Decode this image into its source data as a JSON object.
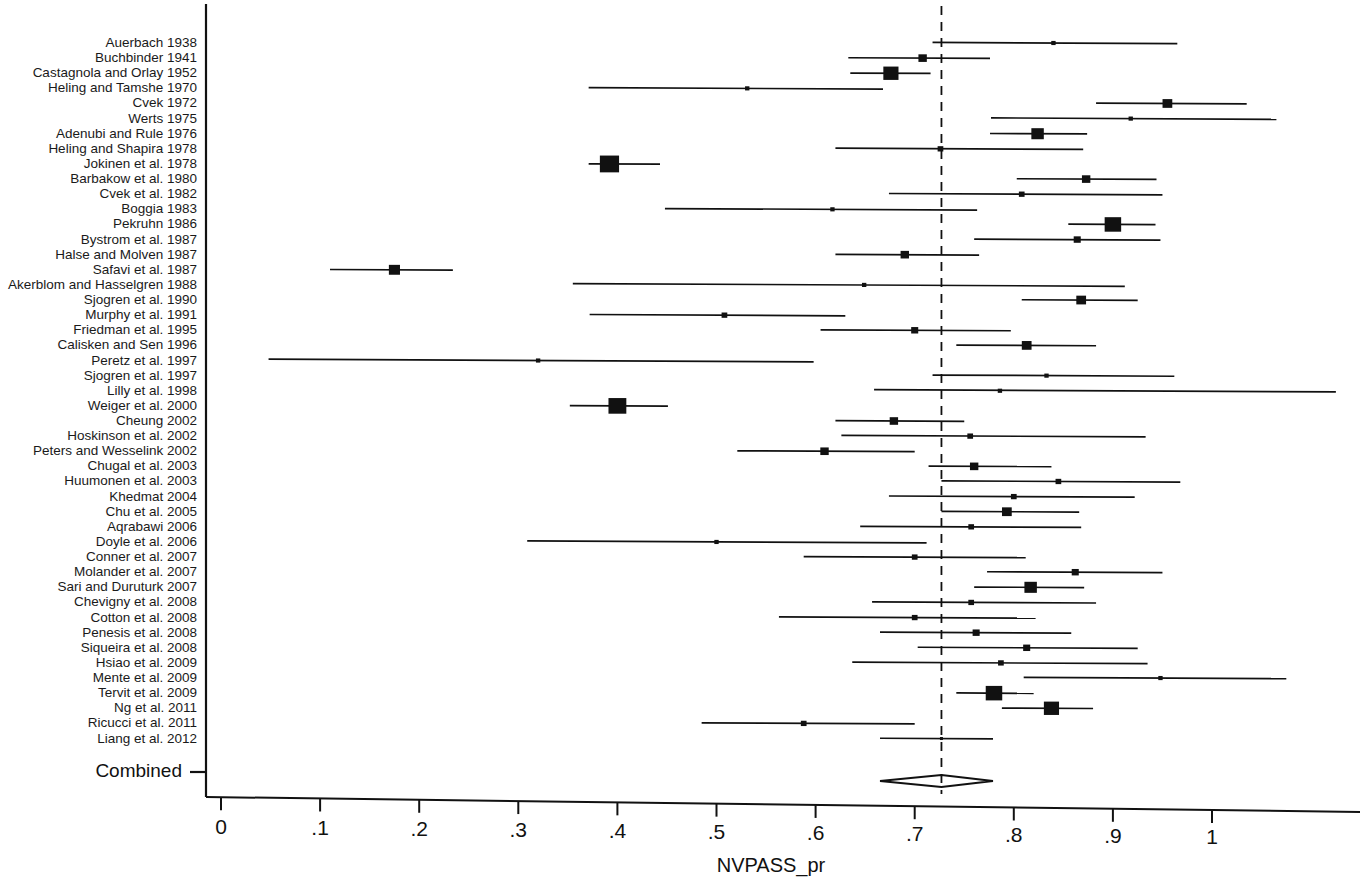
{
  "figure": {
    "type": "forest-plot",
    "axis_title": "NVPASS_pr",
    "combined_label": "Combined",
    "x_ticks": [
      "0",
      ".1",
      ".2",
      ".3",
      ".4",
      ".5",
      ".6",
      ".7",
      ".8",
      ".9",
      "1"
    ]
  },
  "chart_data": {
    "type": "forest",
    "title": "",
    "xlabel": "NVPASS_pr",
    "ylabel": "",
    "xlim": [
      0,
      1.12
    ],
    "xticks": [
      0,
      0.1,
      0.2,
      0.3,
      0.4,
      0.5,
      0.6,
      0.7,
      0.8,
      0.9,
      1.0
    ],
    "xticklabels": [
      "0",
      ".1",
      ".2",
      ".3",
      ".4",
      ".5",
      ".6",
      ".7",
      ".8",
      ".9",
      "1"
    ],
    "grid": false,
    "legend": "none",
    "reference_line": 0.727,
    "reference_line_style": "dashed",
    "effect_measure": "proportion",
    "overall": {
      "label": "Combined",
      "estimate": 0.727,
      "ci_low": 0.665,
      "ci_high": 0.779,
      "marker": "diamond"
    },
    "studies": [
      {
        "label": "Auerbach 1938",
        "estimate": 0.84,
        "ci_low": 0.718,
        "ci_high": 0.965,
        "weight": 1
      },
      {
        "label": "Buchbinder 1941",
        "estimate": 0.708,
        "ci_low": 0.633,
        "ci_high": 0.776,
        "weight": 4
      },
      {
        "label": "Castagnola and Orlay 1952",
        "estimate": 0.676,
        "ci_low": 0.635,
        "ci_high": 0.716,
        "weight": 9
      },
      {
        "label": "Heling and Tamshe 1970",
        "estimate": 0.531,
        "ci_low": 0.371,
        "ci_high": 0.668,
        "weight": 1
      },
      {
        "label": "Cvek 1972",
        "estimate": 0.955,
        "ci_low": 0.883,
        "ci_high": 1.035,
        "weight": 5
      },
      {
        "label": "Werts 1975",
        "estimate": 0.918,
        "ci_low": 0.777,
        "ci_high": 1.065,
        "weight": 1
      },
      {
        "label": "Adenubi and Rule 1976",
        "estimate": 0.824,
        "ci_low": 0.776,
        "ci_high": 0.874,
        "weight": 7
      },
      {
        "label": "Heling and Shapira 1978",
        "estimate": 0.726,
        "ci_low": 0.62,
        "ci_high": 0.87,
        "weight": 2
      },
      {
        "label": "Jokinen et al. 1978",
        "estimate": 0.392,
        "ci_low": 0.371,
        "ci_high": 0.443,
        "weight": 12
      },
      {
        "label": "Barbakow et al. 1980",
        "estimate": 0.873,
        "ci_low": 0.803,
        "ci_high": 0.944,
        "weight": 4
      },
      {
        "label": "Cvek et al. 1982",
        "estimate": 0.808,
        "ci_low": 0.674,
        "ci_high": 0.95,
        "weight": 2
      },
      {
        "label": "Boggia 1983",
        "estimate": 0.617,
        "ci_low": 0.448,
        "ci_high": 0.763,
        "weight": 1
      },
      {
        "label": "Pekruhn 1986",
        "estimate": 0.9,
        "ci_low": 0.855,
        "ci_high": 0.943,
        "weight": 10
      },
      {
        "label": "Bystrom et al. 1987",
        "estimate": 0.864,
        "ci_low": 0.76,
        "ci_high": 0.948,
        "weight": 3
      },
      {
        "label": "Halse and Molven 1987",
        "estimate": 0.69,
        "ci_low": 0.62,
        "ci_high": 0.765,
        "weight": 4
      },
      {
        "label": "Safavi et al. 1987",
        "estimate": 0.175,
        "ci_low": 0.11,
        "ci_high": 0.234,
        "weight": 6
      },
      {
        "label": "Akerblom and Hasselgren 1988",
        "estimate": 0.649,
        "ci_low": 0.355,
        "ci_high": 0.912,
        "weight": 1
      },
      {
        "label": "Sjogren et al. 1990",
        "estimate": 0.868,
        "ci_low": 0.808,
        "ci_high": 0.925,
        "weight": 5
      },
      {
        "label": "Murphy et al. 1991",
        "estimate": 0.508,
        "ci_low": 0.372,
        "ci_high": 0.63,
        "weight": 2
      },
      {
        "label": "Friedman et al. 1995",
        "estimate": 0.7,
        "ci_low": 0.605,
        "ci_high": 0.797,
        "weight": 3
      },
      {
        "label": "Calisken and Sen 1996",
        "estimate": 0.813,
        "ci_low": 0.742,
        "ci_high": 0.883,
        "weight": 5
      },
      {
        "label": "Peretz et al. 1997",
        "estimate": 0.32,
        "ci_low": 0.048,
        "ci_high": 0.598,
        "weight": 1
      },
      {
        "label": "Sjogren et al. 1997",
        "estimate": 0.833,
        "ci_low": 0.718,
        "ci_high": 0.962,
        "weight": 1
      },
      {
        "label": "Lilly et al. 1998",
        "estimate": 0.786,
        "ci_low": 0.659,
        "ci_high": 1.125,
        "weight": 1
      },
      {
        "label": "Weiger et al. 2000",
        "estimate": 0.4,
        "ci_low": 0.352,
        "ci_high": 0.451,
        "weight": 11
      },
      {
        "label": "Cheung 2002",
        "estimate": 0.679,
        "ci_low": 0.62,
        "ci_high": 0.75,
        "weight": 4
      },
      {
        "label": "Hoskinson et al. 2002",
        "estimate": 0.756,
        "ci_low": 0.626,
        "ci_high": 0.933,
        "weight": 2
      },
      {
        "label": "Peters and Wesselink 2002",
        "estimate": 0.609,
        "ci_low": 0.521,
        "ci_high": 0.7,
        "weight": 4
      },
      {
        "label": "Chugal et al. 2003",
        "estimate": 0.76,
        "ci_low": 0.714,
        "ci_high": 0.838,
        "weight": 4
      },
      {
        "label": "Huumonen et al. 2003",
        "estimate": 0.845,
        "ci_low": 0.727,
        "ci_high": 0.968,
        "weight": 2
      },
      {
        "label": "Khedmat 2004",
        "estimate": 0.8,
        "ci_low": 0.674,
        "ci_high": 0.922,
        "weight": 2
      },
      {
        "label": "Chu et al. 2005",
        "estimate": 0.793,
        "ci_low": 0.727,
        "ci_high": 0.866,
        "weight": 5
      },
      {
        "label": "Aqrabawi 2006",
        "estimate": 0.757,
        "ci_low": 0.645,
        "ci_high": 0.868,
        "weight": 2
      },
      {
        "label": "Doyle et al. 2006",
        "estimate": 0.5,
        "ci_low": 0.309,
        "ci_high": 0.712,
        "weight": 1
      },
      {
        "label": "Conner et al. 2007",
        "estimate": 0.7,
        "ci_low": 0.588,
        "ci_high": 0.812,
        "weight": 2
      },
      {
        "label": "Molander et al. 2007",
        "estimate": 0.862,
        "ci_low": 0.773,
        "ci_high": 0.95,
        "weight": 3
      },
      {
        "label": "Sari and Duruturk 2007",
        "estimate": 0.817,
        "ci_low": 0.76,
        "ci_high": 0.871,
        "weight": 7
      },
      {
        "label": "Chevigny et al. 2008",
        "estimate": 0.757,
        "ci_low": 0.657,
        "ci_high": 0.883,
        "weight": 2
      },
      {
        "label": "Cotton et al. 2008",
        "estimate": 0.7,
        "ci_low": 0.563,
        "ci_high": 0.822,
        "weight": 2
      },
      {
        "label": "Penesis et al. 2008",
        "estimate": 0.762,
        "ci_low": 0.665,
        "ci_high": 0.858,
        "weight": 3
      },
      {
        "label": "Siqueira et al. 2008",
        "estimate": 0.813,
        "ci_low": 0.703,
        "ci_high": 0.925,
        "weight": 3
      },
      {
        "label": "Hsiao et al. 2009",
        "estimate": 0.787,
        "ci_low": 0.637,
        "ci_high": 0.935,
        "weight": 2
      },
      {
        "label": "Mente et al. 2009",
        "estimate": 0.948,
        "ci_low": 0.81,
        "ci_high": 1.075,
        "weight": 1
      },
      {
        "label": "Tervit et al. 2009",
        "estimate": 0.78,
        "ci_low": 0.742,
        "ci_high": 0.82,
        "weight": 10
      },
      {
        "label": "Ng et al. 2011",
        "estimate": 0.838,
        "ci_low": 0.788,
        "ci_high": 0.88,
        "weight": 9
      },
      {
        "label": "Ricucci et al. 2011",
        "estimate": 0.588,
        "ci_low": 0.485,
        "ci_high": 0.7,
        "weight": 2
      },
      {
        "label": "Liang et al. 2012",
        "estimate": 0.727,
        "ci_low": 0.665,
        "ci_high": 0.779,
        "weight": 0
      }
    ]
  }
}
